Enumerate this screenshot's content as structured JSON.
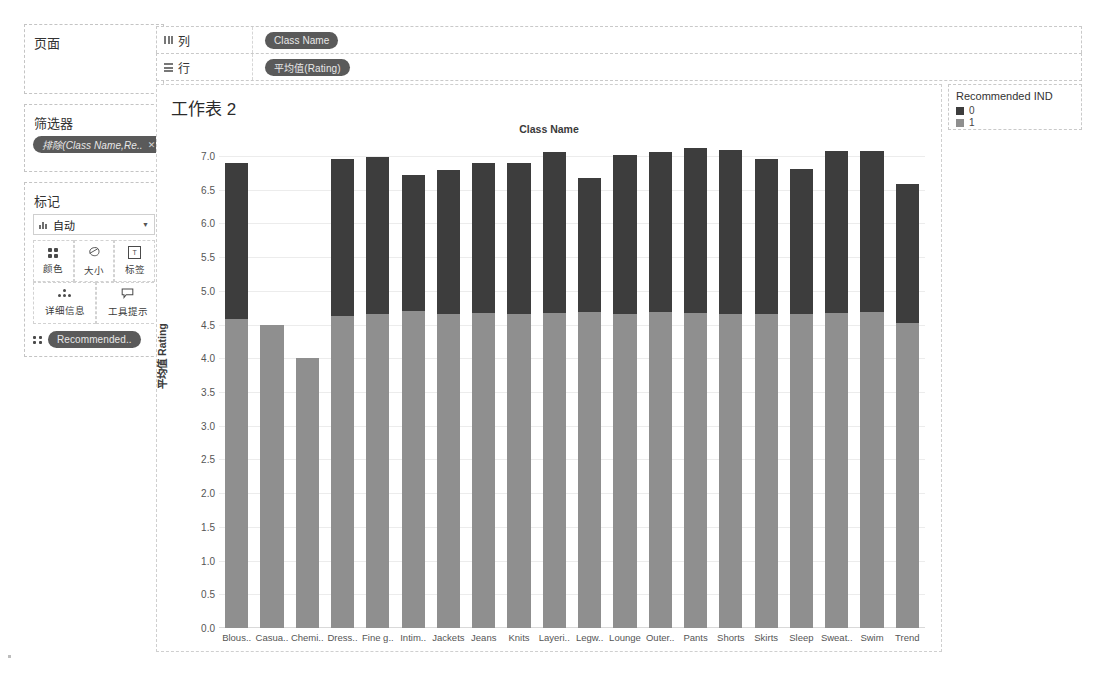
{
  "sidebar": {
    "pages": {
      "title": "页面"
    },
    "filters": {
      "title": "筛选器",
      "pill": "排除(Class Name,Re..",
      "pill_remove": "✕"
    },
    "marks": {
      "title": "标记",
      "mark_type": "自动",
      "mark_type_caret": "▼",
      "buttons": [
        {
          "label": "颜色",
          "icon": "color-icon"
        },
        {
          "label": "大小",
          "icon": "size-icon"
        },
        {
          "label": "标签",
          "icon": "label-icon"
        },
        {
          "label": "详细信息",
          "icon": "detail-icon"
        },
        {
          "label": "工具提示",
          "icon": "tooltip-icon"
        }
      ],
      "color_pill": "Recommended.."
    }
  },
  "shelves": [
    {
      "name": "列",
      "icon": "columns-icon",
      "pill": "Class Name"
    },
    {
      "name": "行",
      "icon": "rows-icon",
      "pill": "平均值(Rating)"
    }
  ],
  "legend": {
    "title": "Recommended IND",
    "items": [
      {
        "label": "0",
        "color": "#3d3d3d"
      },
      {
        "label": "1",
        "color": "#8f8f8f"
      }
    ]
  },
  "view": {
    "worksheet_title": "工作表 2",
    "column_header": "Class Name"
  },
  "chart_data": {
    "type": "bar",
    "stacked": true,
    "title": "工作表 2",
    "xlabel": "Class Name",
    "ylabel": "平均值 Rating",
    "ylim": [
      0,
      7.0
    ],
    "yticks": [
      "0.0",
      "0.5",
      "1.0",
      "1.5",
      "2.0",
      "2.5",
      "3.0",
      "3.5",
      "4.0",
      "4.5",
      "5.0",
      "5.5",
      "6.0",
      "6.5",
      "7.0"
    ],
    "grid": true,
    "legend_title": "Recommended IND",
    "legend_position": "right",
    "categories": [
      "Blous..",
      "Casua..",
      "Chemi..",
      "Dress..",
      "Fine g..",
      "Intim..",
      "Jackets",
      "Jeans",
      "Knits",
      "Layeri..",
      "Legw..",
      "Lounge",
      "Outer..",
      "Pants",
      "Shorts",
      "Skirts",
      "Sleep",
      "Sweat..",
      "Swim",
      "Trend"
    ],
    "series": [
      {
        "name": "1",
        "color": "#8f8f8f",
        "values": [
          4.58,
          4.5,
          4.0,
          4.62,
          4.65,
          4.7,
          4.66,
          4.67,
          4.65,
          4.67,
          4.68,
          4.66,
          4.68,
          4.67,
          4.66,
          4.66,
          4.65,
          4.67,
          4.68,
          4.52
        ]
      },
      {
        "name": "0",
        "color": "#3d3d3d",
        "values": [
          2.32,
          0.0,
          0.0,
          2.33,
          2.34,
          2.02,
          2.14,
          2.23,
          2.25,
          2.39,
          1.99,
          2.35,
          2.38,
          2.45,
          2.43,
          2.29,
          2.16,
          2.41,
          2.39,
          2.06
        ]
      }
    ],
    "totals": [
      6.9,
      4.5,
      4.0,
      6.95,
      6.99,
      6.72,
      6.8,
      6.9,
      6.9,
      7.06,
      6.67,
      7.01,
      7.06,
      7.12,
      7.09,
      6.95,
      6.81,
      7.08,
      7.07,
      6.58
    ]
  }
}
